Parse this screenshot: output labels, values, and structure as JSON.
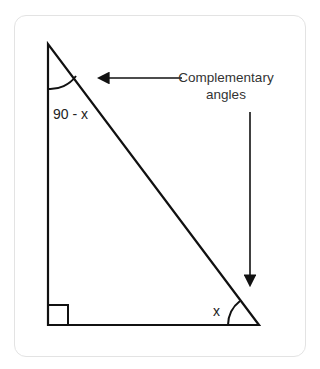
{
  "diagram": {
    "labels": {
      "top_angle": "90 - x",
      "bottom_angle": "x",
      "annotation_line1": "Complementary",
      "annotation_line2": "angles"
    },
    "colors": {
      "stroke": "#111111",
      "text": "#222222",
      "card_border": "#e3e3e3"
    }
  }
}
